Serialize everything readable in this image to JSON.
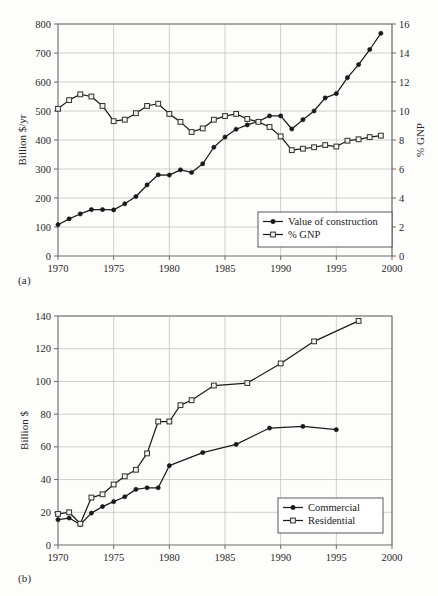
{
  "figure": {
    "panel_a_label": "(a)",
    "panel_b_label": "(b)"
  },
  "chart_data": [
    {
      "id": "chart-a",
      "type": "line",
      "title": "",
      "subtitle": "",
      "panel": "(a)",
      "xlabel": "",
      "ylabel": "Billion $/yr",
      "y2label": "% GNP",
      "xlim": [
        1970,
        2000
      ],
      "ylim": [
        0,
        800
      ],
      "y2lim": [
        0,
        16
      ],
      "xticks": [
        1970,
        1975,
        1980,
        1985,
        1990,
        1995,
        2000
      ],
      "xticklabels": [
        "1970",
        "1975",
        "1980",
        "1985",
        "1990",
        "1995",
        "2000"
      ],
      "yticks": [
        0,
        100,
        200,
        300,
        400,
        500,
        600,
        700,
        800
      ],
      "yticklabels": [
        "0",
        "100",
        "200",
        "300",
        "400",
        "500",
        "600",
        "700",
        "800"
      ],
      "y2ticks": [
        0,
        2,
        4,
        6,
        8,
        10,
        12,
        14,
        16
      ],
      "y2ticklabels": [
        "0",
        "2",
        "4",
        "6",
        "8",
        "10",
        "12",
        "14",
        "16"
      ],
      "grid": true,
      "legend_position": "lower-right",
      "series": [
        {
          "name": "Value of construction",
          "axis": "left",
          "marker": "filled-circle",
          "x": [
            1970,
            1971,
            1972,
            1973,
            1974,
            1975,
            1976,
            1977,
            1978,
            1979,
            1980,
            1981,
            1982,
            1983,
            1984,
            1985,
            1986,
            1987,
            1988,
            1989,
            1990,
            1991,
            1992,
            1993,
            1994,
            1995,
            1996,
            1997,
            1998,
            1999
          ],
          "values": [
            108,
            128,
            145,
            160,
            160,
            159,
            180,
            205,
            245,
            280,
            279,
            297,
            288,
            318,
            375,
            410,
            437,
            452,
            464,
            483,
            483,
            438,
            470,
            500,
            545,
            560,
            615,
            660,
            712,
            768
          ]
        },
        {
          "name": "% GNP",
          "axis": "right",
          "marker": "open-square",
          "x": [
            1970,
            1971,
            1972,
            1973,
            1974,
            1975,
            1976,
            1977,
            1978,
            1979,
            1980,
            1981,
            1982,
            1983,
            1984,
            1985,
            1986,
            1987,
            1988,
            1989,
            1990,
            1991,
            1992,
            1993,
            1994,
            1995,
            1996,
            1997,
            1998,
            1999
          ],
          "values": [
            10.15,
            10.75,
            11.15,
            11.0,
            10.35,
            9.3,
            9.4,
            9.85,
            10.35,
            10.5,
            9.8,
            9.25,
            8.55,
            8.8,
            9.4,
            9.65,
            9.8,
            9.45,
            9.25,
            8.9,
            8.25,
            7.3,
            7.4,
            7.5,
            7.65,
            7.55,
            7.95,
            8.05,
            8.2,
            8.3
          ]
        }
      ]
    },
    {
      "id": "chart-b",
      "type": "line",
      "title": "",
      "panel": "(b)",
      "xlabel": "",
      "ylabel": "Billion $",
      "xlim": [
        1970,
        2000
      ],
      "ylim": [
        0,
        140
      ],
      "xticks": [
        1970,
        1975,
        1980,
        1985,
        1990,
        1995,
        2000
      ],
      "xticklabels": [
        "1970",
        "1975",
        "1980",
        "1985",
        "1990",
        "1995",
        "2000"
      ],
      "yticks": [
        0,
        20,
        40,
        60,
        80,
        100,
        120,
        140
      ],
      "yticklabels": [
        "0",
        "20",
        "40",
        "60",
        "80",
        "100",
        "120",
        "140"
      ],
      "grid": true,
      "legend_position": "lower-right",
      "series": [
        {
          "name": "Commercial",
          "axis": "left",
          "marker": "filled-circle",
          "x": [
            1970,
            1971,
            1972,
            1973,
            1974,
            1975,
            1976,
            1977,
            1978,
            1979,
            1980,
            1983,
            1986,
            1989,
            1992,
            1995
          ],
          "values": [
            15.5,
            16.5,
            12.5,
            19.5,
            23.5,
            26.5,
            29.5,
            34,
            35,
            35,
            48.5,
            56.5,
            61.5,
            71.5,
            72.5,
            70.5
          ]
        },
        {
          "name": "Residential",
          "axis": "left",
          "marker": "open-square",
          "x": [
            1970,
            1971,
            1972,
            1973,
            1974,
            1975,
            1976,
            1977,
            1978,
            1979,
            1980,
            1981,
            1982,
            1984,
            1987,
            1990,
            1993,
            1997
          ],
          "values": [
            19,
            20,
            13,
            29,
            31,
            37,
            42,
            46,
            56,
            75.5,
            75.5,
            85.5,
            88.5,
            97.5,
            99,
            111,
            124.5,
            137
          ]
        }
      ]
    }
  ]
}
